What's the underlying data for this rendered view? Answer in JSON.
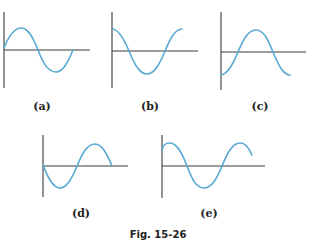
{
  "figure": {
    "caption": "Fig. 15-26",
    "wave_color": "#5aa9d4",
    "axis_color": "#3a3a3a",
    "panels": [
      {
        "id": "a",
        "label": "(a)",
        "description": "sine wave starting at origin going up: peak, trough, ends on axis"
      },
      {
        "id": "b",
        "label": "(b)",
        "description": "cosine-like wave starting at maximum: trough, returns to maximum"
      },
      {
        "id": "c",
        "label": "(c)",
        "description": "wave starting at minimum: rises to peak, descends below axis"
      },
      {
        "id": "d",
        "label": "(d)",
        "description": "negative sine starting at origin going down: trough, peak, ends on axis"
      },
      {
        "id": "e",
        "label": "(e)",
        "description": "wave starting near maximum: trough, peak, starts descending"
      }
    ]
  }
}
